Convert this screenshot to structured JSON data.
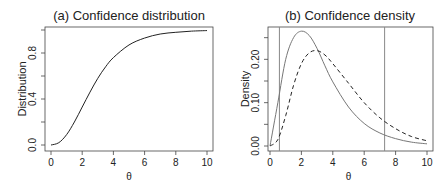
{
  "chart_data": [
    {
      "type": "line",
      "title": "(a) Confidence distribution",
      "xlabel": "θ",
      "ylabel": "Distribution",
      "xlim": [
        0,
        10
      ],
      "ylim": [
        0,
        1
      ],
      "xticks": [
        "0",
        "2",
        "4",
        "6",
        "8",
        "10"
      ],
      "yticks": [
        "0.0",
        "0.4",
        "0.8"
      ],
      "grid": false,
      "series": [
        {
          "name": "Confidence distribution",
          "style": "solid",
          "x": [
            0,
            0.5,
            1,
            1.5,
            2,
            2.5,
            3,
            3.5,
            4,
            5,
            6,
            7,
            8,
            9,
            10
          ],
          "values": [
            0,
            0.02,
            0.09,
            0.2,
            0.33,
            0.46,
            0.58,
            0.68,
            0.76,
            0.87,
            0.93,
            0.965,
            0.98,
            0.99,
            0.995
          ]
        }
      ]
    },
    {
      "type": "line",
      "title": "(b) Confidence density",
      "xlabel": "θ",
      "ylabel": "Density",
      "xlim": [
        0,
        10
      ],
      "ylim": [
        0,
        0.27
      ],
      "xticks": [
        "0",
        "2",
        "4",
        "6",
        "8",
        "10"
      ],
      "yticks": [
        "0.00",
        "0.10",
        "0.20"
      ],
      "grid": false,
      "vlines": [
        0.6,
        7.3
      ],
      "series": [
        {
          "name": "Confidence density",
          "style": "solid",
          "x": [
            0,
            0.5,
            1,
            1.5,
            2,
            2.5,
            3,
            3.5,
            4,
            5,
            6,
            7,
            8,
            9,
            10
          ],
          "values": [
            0,
            0.1,
            0.2,
            0.25,
            0.265,
            0.255,
            0.225,
            0.185,
            0.148,
            0.09,
            0.052,
            0.03,
            0.017,
            0.009,
            0.005
          ]
        },
        {
          "name": "Comparison density",
          "style": "dashed",
          "x": [
            0,
            0.5,
            1,
            1.5,
            2,
            2.5,
            3,
            3.5,
            4,
            5,
            6,
            7,
            8,
            9,
            10
          ],
          "values": [
            0,
            0.015,
            0.07,
            0.14,
            0.19,
            0.215,
            0.22,
            0.21,
            0.19,
            0.145,
            0.1,
            0.065,
            0.04,
            0.022,
            0.012
          ]
        }
      ]
    }
  ]
}
